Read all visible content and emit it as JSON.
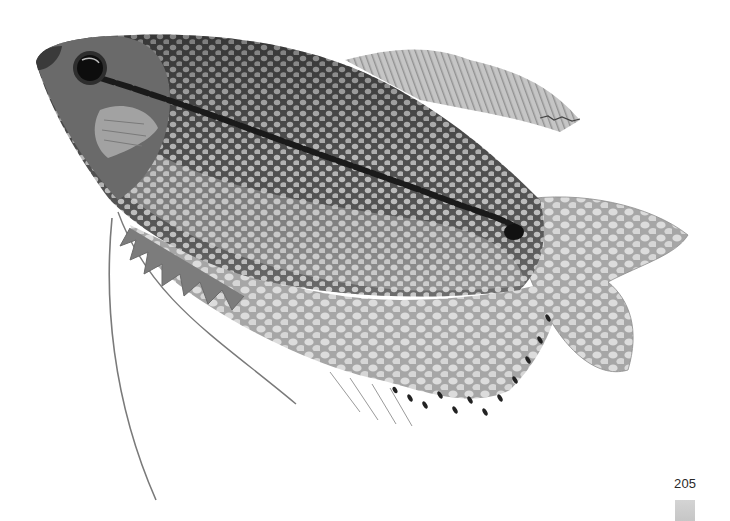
{
  "page": {
    "page_number": "205",
    "background_color": "#ffffff",
    "tab_color": "#c9c9c9"
  },
  "photo": {
    "subject": "pearl gourami fish",
    "palette": {
      "body_dark": "#4a4a4a",
      "body_mid": "#6e6e6e",
      "spots": "#c8c8c8",
      "fin": "#b4b4b4",
      "fin_light": "#d8d8d8",
      "stripe": "#1c1c1c",
      "eye": "#0e0e0e"
    }
  }
}
